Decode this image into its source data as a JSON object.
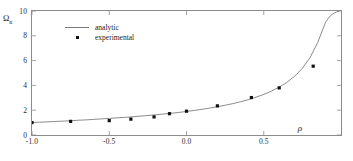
{
  "chart_data": {
    "type": "scatter",
    "title": "",
    "xlabel": "ρ",
    "ylabel": "Ω",
    "ylabel_sub": "n",
    "xlim": [
      -1.0,
      1.0
    ],
    "ylim": [
      0,
      10
    ],
    "xticks": [
      -1.0,
      -0.5,
      0.0,
      0.5
    ],
    "xtick_labels": [
      "-1.0",
      "-0.5",
      "0.0",
      "0.5"
    ],
    "yticks": [
      0,
      2,
      4,
      6,
      8,
      10
    ],
    "ytick_labels": [
      "0",
      "2",
      "4",
      "6",
      "8",
      "10"
    ],
    "grid": false,
    "legend_position": "upper-left-inside",
    "series": [
      {
        "name": "analytic",
        "type": "line",
        "color": "#6f6f6f",
        "x": [
          -1.0,
          -0.95,
          -0.9,
          -0.85,
          -0.8,
          -0.75,
          -0.7,
          -0.65,
          -0.6,
          -0.55,
          -0.5,
          -0.45,
          -0.4,
          -0.35,
          -0.3,
          -0.25,
          -0.2,
          -0.15,
          -0.1,
          -0.05,
          0.0,
          0.05,
          0.1,
          0.15,
          0.2,
          0.25,
          0.3,
          0.35,
          0.4,
          0.45,
          0.5,
          0.55,
          0.6,
          0.65,
          0.7,
          0.75,
          0.8,
          0.85,
          0.9,
          0.93,
          0.95,
          0.97,
          0.99
        ],
        "values": [
          1.0,
          1.03,
          1.06,
          1.09,
          1.12,
          1.15,
          1.19,
          1.22,
          1.26,
          1.3,
          1.34,
          1.38,
          1.42,
          1.47,
          1.52,
          1.57,
          1.63,
          1.69,
          1.75,
          1.82,
          1.9,
          1.98,
          2.07,
          2.17,
          2.28,
          2.4,
          2.53,
          2.68,
          2.85,
          3.05,
          3.27,
          3.54,
          3.86,
          4.25,
          4.74,
          5.38,
          6.25,
          7.48,
          9.1,
          9.6,
          9.8,
          9.92,
          10.0
        ]
      },
      {
        "name": "experimental",
        "type": "scatter",
        "color": "#111111",
        "marker": "square",
        "x": [
          -1.0,
          -0.75,
          -0.5,
          -0.36,
          -0.21,
          -0.11,
          0.0,
          0.2,
          0.42,
          0.6,
          0.82
        ],
        "values": [
          1.0,
          1.1,
          1.16,
          1.28,
          1.46,
          1.72,
          1.92,
          2.35,
          3.02,
          3.8,
          5.55
        ]
      }
    ],
    "legend": [
      {
        "label": "analytic",
        "key": "line-key"
      },
      {
        "label": "experimental",
        "key": "dot-key"
      }
    ]
  }
}
